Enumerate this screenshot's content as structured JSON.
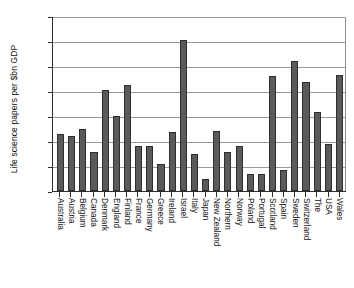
{
  "chart_data": {
    "type": "bar",
    "title": "",
    "xlabel": "",
    "ylabel": "Life science papers per $bn GDP",
    "ylim": [
      0,
      140
    ],
    "ytick_labels": [
      "0",
      "20",
      "40",
      "60",
      "80",
      "100",
      "120",
      "140"
    ],
    "yticks": [
      0,
      20,
      40,
      60,
      80,
      100,
      120,
      140
    ],
    "grid": true,
    "legend": "none",
    "bar_color": "#5a5a5a",
    "bar_edge_color": "#2e2e2e",
    "categories": [
      "Australia",
      "Austria",
      "Belgium",
      "Canada",
      "Denmark",
      "England",
      "Finland",
      "France",
      "Germany",
      "Greece",
      "Ireland",
      "Israel",
      "Italy",
      "Japan",
      "New Zealand",
      "Northern",
      "Norway",
      "Poland",
      "Portugal",
      "Scotland",
      "Spain",
      "Sweden",
      "Switzerland",
      "The",
      "USA",
      "Wales"
    ],
    "values": [
      46,
      44,
      50,
      31,
      81,
      60,
      85,
      36,
      36,
      22,
      47,
      121,
      30,
      10,
      48,
      31,
      36,
      14,
      14,
      92,
      17,
      104,
      87,
      63,
      38,
      93
    ]
  }
}
